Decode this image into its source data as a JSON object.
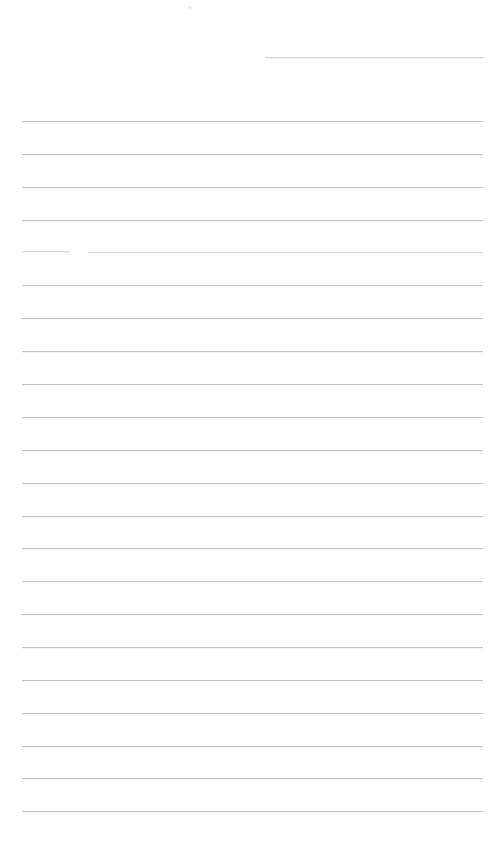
{
  "document": {
    "kind": "scanned-page",
    "description": "Blank ruled notebook page scan",
    "page_width": 501,
    "page_height": 842,
    "background_color": "#ffffff",
    "rule_color": "#c2c6ca",
    "rule_thickness_px": 1,
    "rule_spacing_px": 32.8,
    "text_content": "",
    "visible_text_lines": []
  },
  "rules": [
    {
      "id": "rule-00",
      "y": 57,
      "x_start": 265,
      "x_end": 483,
      "weight": "faint",
      "note": "partial top rule, left portion missing"
    },
    {
      "id": "rule-01",
      "y": 121,
      "x_start": 22,
      "x_end": 483,
      "weight": "normal",
      "note": ""
    },
    {
      "id": "rule-02",
      "y": 154,
      "x_start": 22,
      "x_end": 483,
      "weight": "normal",
      "note": ""
    },
    {
      "id": "rule-03",
      "y": 187,
      "x_start": 22,
      "x_end": 483,
      "weight": "normal",
      "note": ""
    },
    {
      "id": "rule-04",
      "y": 220,
      "x_start": 22,
      "x_end": 483,
      "weight": "normal",
      "note": ""
    },
    {
      "id": "rule-05a",
      "y": 251,
      "x_start": 22,
      "x_end": 70,
      "weight": "very-faint",
      "note": "broken rule - left fragment"
    },
    {
      "id": "rule-05b",
      "y": 252,
      "x_start": 88,
      "x_end": 483,
      "weight": "very-faint",
      "note": "broken rule - right fragment"
    },
    {
      "id": "rule-06",
      "y": 285,
      "x_start": 22,
      "x_end": 483,
      "weight": "normal",
      "note": ""
    },
    {
      "id": "rule-07",
      "y": 318,
      "x_start": 22,
      "x_end": 483,
      "weight": "normal",
      "note": ""
    },
    {
      "id": "rule-08",
      "y": 351,
      "x_start": 22,
      "x_end": 483,
      "weight": "normal",
      "note": ""
    },
    {
      "id": "rule-09",
      "y": 384,
      "x_start": 22,
      "x_end": 483,
      "weight": "normal",
      "note": ""
    },
    {
      "id": "rule-10",
      "y": 417,
      "x_start": 22,
      "x_end": 483,
      "weight": "normal",
      "note": ""
    },
    {
      "id": "rule-11",
      "y": 450,
      "x_start": 22,
      "x_end": 483,
      "weight": "normal",
      "note": ""
    },
    {
      "id": "rule-12",
      "y": 483,
      "x_start": 22,
      "x_end": 483,
      "weight": "normal",
      "note": ""
    },
    {
      "id": "rule-13",
      "y": 516,
      "x_start": 22,
      "x_end": 483,
      "weight": "normal",
      "note": ""
    },
    {
      "id": "rule-14",
      "y": 548,
      "x_start": 22,
      "x_end": 483,
      "weight": "normal",
      "note": ""
    },
    {
      "id": "rule-15",
      "y": 581,
      "x_start": 22,
      "x_end": 483,
      "weight": "normal",
      "note": ""
    },
    {
      "id": "rule-16",
      "y": 614,
      "x_start": 22,
      "x_end": 483,
      "weight": "normal",
      "note": ""
    },
    {
      "id": "rule-17",
      "y": 647,
      "x_start": 22,
      "x_end": 483,
      "weight": "normal",
      "note": ""
    },
    {
      "id": "rule-18",
      "y": 680,
      "x_start": 22,
      "x_end": 483,
      "weight": "normal",
      "note": ""
    },
    {
      "id": "rule-19",
      "y": 713,
      "x_start": 22,
      "x_end": 483,
      "weight": "normal",
      "note": ""
    },
    {
      "id": "rule-20",
      "y": 746,
      "x_start": 22,
      "x_end": 483,
      "weight": "normal",
      "note": ""
    },
    {
      "id": "rule-21",
      "y": 778,
      "x_start": 22,
      "x_end": 483,
      "weight": "normal",
      "note": ""
    },
    {
      "id": "rule-22",
      "y": 811,
      "x_start": 22,
      "x_end": 483,
      "weight": "normal",
      "note": ""
    }
  ],
  "artifacts": [
    {
      "id": "speck-01",
      "x": 188,
      "y": 6,
      "w": 4,
      "h": 3,
      "note": "faint scanner speck near top margin"
    }
  ]
}
